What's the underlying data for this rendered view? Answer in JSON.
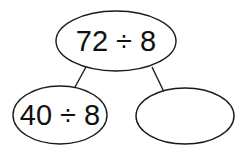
{
  "diagram": {
    "type": "number-bond-tree",
    "root": {
      "text": "72 ÷ 8"
    },
    "children": [
      {
        "text": "40 ÷ 8"
      },
      {
        "text": ""
      }
    ]
  },
  "colors": {
    "stroke": "#1a1a1a",
    "text": "#111111",
    "background": "#ffffff"
  }
}
